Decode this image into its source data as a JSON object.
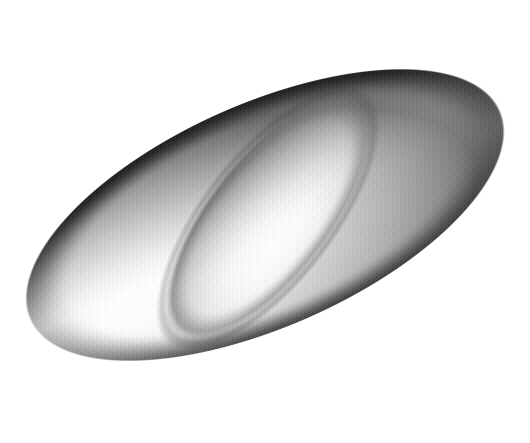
{
  "image": {
    "title": "Shaded 3D self-intersecting surface",
    "subject": "cross-cap-surface",
    "width": 530,
    "height": 443,
    "background_color": "#ffffff",
    "render_style": "halftone-dithered-grayscale",
    "texture": "ordered-dither-halftone",
    "has_text": false,
    "has_axes": false,
    "has_legend": false,
    "alt_text": "A smooth elongated three-dimensional surface shaded in grays, tilted diagonally from lower-left to upper-right, with an inner folded lobe that self-intersects through the middle."
  },
  "geometry": {
    "body": {
      "name": "outer-lobe",
      "center_x": 265,
      "center_y": 215,
      "radius_x": 258,
      "radius_y": 112,
      "rotation_deg": -24,
      "top_extent_y": 25,
      "bottom_extent_y": 392,
      "left_extent_x": 12,
      "right_extent_x": 518
    },
    "inner_fold": {
      "name": "inner-lobe",
      "center_x": 268,
      "center_y": 218,
      "radius_x": 150,
      "radius_y": 62,
      "rotation_deg": -52,
      "cusp_top_x": 262,
      "cusp_top_y": 92,
      "cusp_bottom_x": 215,
      "cusp_bottom_y": 352
    }
  },
  "shading": {
    "light_direction_deg": 300,
    "tones": {
      "highlight": "#e6e6e6",
      "light": "#cfcfcf",
      "mid_light": "#b4b4b4",
      "mid": "#9a9a9a",
      "mid_dark": "#7e7e7e",
      "dark": "#5e5e5e",
      "rim_dark": "#2e2e2e",
      "deep_shadow": "#1a1a1a",
      "background": "#ffffff"
    },
    "features": [
      {
        "name": "upper-rim-shadow",
        "description": "dark narrow band along the upper-left boundary",
        "tone": "#2e2e2e"
      },
      {
        "name": "lower-right-rim-shadow",
        "description": "dark band along the lower-right boundary",
        "tone": "#2e2e2e"
      },
      {
        "name": "central-highlight-band",
        "description": "bright diagonal highlight through the middle of the body",
        "tone": "#e0e0e0"
      },
      {
        "name": "right-lobe-shading",
        "description": "rounded right end falling from light to mid gray",
        "tone": "#b0b0b0"
      },
      {
        "name": "left-lobe-shading",
        "description": "rounded left end in mid gray with soft gradient",
        "tone": "#a8a8a8"
      },
      {
        "name": "fold-crease",
        "description": "darker crease where the inner lobe passes behind the outer surface",
        "tone": "#6a6a6a"
      }
    ]
  }
}
